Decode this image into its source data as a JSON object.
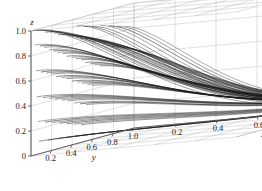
{
  "figure": {
    "type": "3d-line-plot",
    "background": "#ffffff",
    "curve_color": "#1a1a1a",
    "grid_color": "#b9b9b9",
    "axis_color": "#555555"
  },
  "axes": {
    "x": {
      "title": "x",
      "ticks": [
        "0.2",
        "0.4",
        "0.6",
        "0.8",
        "1.0"
      ],
      "tick_values": [
        0.2,
        0.4,
        0.6,
        0.8,
        1.0
      ],
      "range": [
        0,
        1
      ]
    },
    "y": {
      "title": "y",
      "ticks": [
        "0.2",
        "0.4",
        "0.6",
        "0.8",
        "1.0"
      ],
      "tick_values": [
        0.2,
        0.4,
        0.6,
        0.8,
        1.0
      ],
      "range": [
        0,
        1
      ]
    },
    "z": {
      "title": "z",
      "ticks": [
        "0",
        "0.2",
        "0.4",
        "0.6",
        "0.8",
        "1.0"
      ],
      "tick_values": [
        0,
        0.2,
        0.4,
        0.6,
        0.8,
        1.0
      ],
      "range": [
        0,
        1
      ]
    }
  },
  "chart_data": {
    "type": "line",
    "title": "",
    "xlabel": "x",
    "ylabel": "y",
    "zlabel": "z",
    "xlim": [
      0,
      1
    ],
    "ylim": [
      0,
      1
    ],
    "zlim": [
      0,
      1
    ],
    "grid": true,
    "legend": null,
    "projection": {
      "origin_px": [
        31,
        156
      ],
      "x_axis_vector_px": [
        205,
        -19
      ],
      "y_axis_vector_px": [
        103,
        -28
      ],
      "z_axis_vector_px": [
        0,
        -125
      ],
      "note": "corner at x=0,y=0,z=0 is front-bottom; y increases to lower-left-front, x increases to right"
    },
    "series_description": "Family of decaying trajectories; each curve starts on the back-left wall at a given z0 and y0, sweeps across increasing x while z decays to 0, converging near (x=1, y=1, z=0).",
    "series": [
      {
        "name": "t01",
        "z0": 1.0,
        "y0": 0.02,
        "x0": 0.0,
        "decay": 3.2,
        "ybend": 0.97
      },
      {
        "name": "t02",
        "z0": 0.99,
        "y0": 0.06,
        "x0": 0.0,
        "decay": 3.0,
        "ybend": 0.95
      },
      {
        "name": "t03",
        "z0": 0.98,
        "y0": 0.1,
        "x0": 0.0,
        "decay": 2.9,
        "ybend": 0.93
      },
      {
        "name": "t04",
        "z0": 0.96,
        "y0": 0.14,
        "x0": 0.0,
        "decay": 2.8,
        "ybend": 0.92
      },
      {
        "name": "t05",
        "z0": 0.95,
        "y0": 0.19,
        "x0": 0.0,
        "decay": 2.7,
        "ybend": 0.9
      },
      {
        "name": "t06",
        "z0": 0.93,
        "y0": 0.23,
        "x0": 0.0,
        "decay": 2.6,
        "ybend": 0.89
      },
      {
        "name": "t07",
        "z0": 0.91,
        "y0": 0.27,
        "x0": 0.0,
        "decay": 2.55,
        "ybend": 0.88
      },
      {
        "name": "t08",
        "z0": 0.9,
        "y0": 0.31,
        "x0": 0.0,
        "decay": 2.5,
        "ybend": 0.87
      },
      {
        "name": "t09",
        "z0": 0.88,
        "y0": 0.36,
        "x0": 0.0,
        "decay": 2.45,
        "ybend": 0.86
      },
      {
        "name": "t10",
        "z0": 0.87,
        "y0": 0.4,
        "x0": 0.0,
        "decay": 2.4,
        "ybend": 0.85
      },
      {
        "name": "t11",
        "z0": 0.85,
        "y0": 0.44,
        "x0": 0.0,
        "decay": 2.35,
        "ybend": 0.85
      },
      {
        "name": "t12",
        "z0": 0.83,
        "y0": 0.48,
        "x0": 0.0,
        "decay": 2.3,
        "ybend": 0.84
      },
      {
        "name": "t13",
        "z0": 0.82,
        "y0": 0.53,
        "x0": 0.0,
        "decay": 2.25,
        "ybend": 0.84
      },
      {
        "name": "t14",
        "z0": 0.8,
        "y0": 0.57,
        "x0": 0.0,
        "decay": 2.2,
        "ybend": 0.83
      },
      {
        "name": "t15",
        "z0": 0.78,
        "y0": 0.61,
        "x0": 0.0,
        "decay": 2.15,
        "ybend": 0.83
      },
      {
        "name": "t16",
        "z0": 0.76,
        "y0": 0.66,
        "x0": 0.0,
        "decay": 2.1,
        "ybend": 0.82
      },
      {
        "name": "t17",
        "z0": 0.74,
        "y0": 0.7,
        "x0": 0.0,
        "decay": 2.05,
        "ybend": 0.82
      },
      {
        "name": "t18",
        "z0": 0.72,
        "y0": 0.74,
        "x0": 0.0,
        "decay": 2.0,
        "ybend": 0.82
      },
      {
        "name": "t19",
        "z0": 0.7,
        "y0": 0.79,
        "x0": 0.0,
        "decay": 1.95,
        "ybend": 0.81
      },
      {
        "name": "t20",
        "z0": 0.68,
        "y0": 0.83,
        "x0": 0.0,
        "decay": 1.9,
        "ybend": 0.81
      },
      {
        "name": "t21",
        "z0": 0.88,
        "y0": 0.04,
        "x0": 0.0,
        "decay": 2.6,
        "ybend": 0.94
      },
      {
        "name": "t22",
        "z0": 0.86,
        "y0": 0.09,
        "x0": 0.0,
        "decay": 2.5,
        "ybend": 0.92
      },
      {
        "name": "t23",
        "z0": 0.84,
        "y0": 0.13,
        "x0": 0.0,
        "decay": 2.45,
        "ybend": 0.91
      },
      {
        "name": "t24",
        "z0": 0.81,
        "y0": 0.18,
        "x0": 0.0,
        "decay": 2.4,
        "ybend": 0.9
      },
      {
        "name": "t25",
        "z0": 0.79,
        "y0": 0.22,
        "x0": 0.0,
        "decay": 2.3,
        "ybend": 0.89
      },
      {
        "name": "t26",
        "z0": 0.77,
        "y0": 0.26,
        "x0": 0.0,
        "decay": 2.25,
        "ybend": 0.88
      },
      {
        "name": "t27",
        "z0": 0.75,
        "y0": 0.31,
        "x0": 0.0,
        "decay": 2.2,
        "ybend": 0.87
      },
      {
        "name": "t28",
        "z0": 0.72,
        "y0": 0.35,
        "x0": 0.0,
        "decay": 2.15,
        "ybend": 0.86
      },
      {
        "name": "t29",
        "z0": 0.7,
        "y0": 0.4,
        "x0": 0.0,
        "decay": 2.1,
        "ybend": 0.86
      },
      {
        "name": "t30",
        "z0": 0.68,
        "y0": 0.44,
        "x0": 0.0,
        "decay": 2.05,
        "ybend": 0.85
      },
      {
        "name": "t31",
        "z0": 0.66,
        "y0": 0.49,
        "x0": 0.0,
        "decay": 2.0,
        "ybend": 0.85
      },
      {
        "name": "t32",
        "z0": 0.63,
        "y0": 0.53,
        "x0": 0.0,
        "decay": 1.95,
        "ybend": 0.84
      },
      {
        "name": "t33",
        "z0": 0.61,
        "y0": 0.58,
        "x0": 0.0,
        "decay": 1.9,
        "ybend": 0.84
      },
      {
        "name": "t34",
        "z0": 0.59,
        "y0": 0.62,
        "x0": 0.0,
        "decay": 1.85,
        "ybend": 0.83
      },
      {
        "name": "t35",
        "z0": 0.57,
        "y0": 0.67,
        "x0": 0.0,
        "decay": 1.8,
        "ybend": 0.83
      },
      {
        "name": "t36",
        "z0": 0.67,
        "y0": 0.05,
        "x0": 0.0,
        "decay": 2.2,
        "ybend": 0.93
      },
      {
        "name": "t37",
        "z0": 0.65,
        "y0": 0.1,
        "x0": 0.0,
        "decay": 2.15,
        "ybend": 0.91
      },
      {
        "name": "t38",
        "z0": 0.63,
        "y0": 0.15,
        "x0": 0.0,
        "decay": 2.1,
        "ybend": 0.9
      },
      {
        "name": "t39",
        "z0": 0.61,
        "y0": 0.2,
        "x0": 0.0,
        "decay": 2.05,
        "ybend": 0.89
      },
      {
        "name": "t40",
        "z0": 0.58,
        "y0": 0.25,
        "x0": 0.0,
        "decay": 2.0,
        "ybend": 0.88
      },
      {
        "name": "t41",
        "z0": 0.56,
        "y0": 0.3,
        "x0": 0.0,
        "decay": 1.95,
        "ybend": 0.87
      },
      {
        "name": "t42",
        "z0": 0.54,
        "y0": 0.35,
        "x0": 0.0,
        "decay": 1.9,
        "ybend": 0.86
      },
      {
        "name": "t43",
        "z0": 0.51,
        "y0": 0.4,
        "x0": 0.0,
        "decay": 1.85,
        "ybend": 0.86
      },
      {
        "name": "t44",
        "z0": 0.49,
        "y0": 0.45,
        "x0": 0.0,
        "decay": 1.8,
        "ybend": 0.85
      },
      {
        "name": "t45",
        "z0": 0.47,
        "y0": 0.5,
        "x0": 0.0,
        "decay": 1.75,
        "ybend": 0.85
      },
      {
        "name": "t46",
        "z0": 0.45,
        "y0": 0.55,
        "x0": 0.0,
        "decay": 1.7,
        "ybend": 0.84
      },
      {
        "name": "t47",
        "z0": 0.43,
        "y0": 0.6,
        "x0": 0.0,
        "decay": 1.68,
        "ybend": 0.84
      },
      {
        "name": "t48",
        "z0": 0.46,
        "y0": 0.06,
        "x0": 0.0,
        "decay": 1.85,
        "ybend": 0.92
      },
      {
        "name": "t49",
        "z0": 0.44,
        "y0": 0.12,
        "x0": 0.0,
        "decay": 1.8,
        "ybend": 0.9
      },
      {
        "name": "t50",
        "z0": 0.42,
        "y0": 0.18,
        "x0": 0.0,
        "decay": 1.78,
        "ybend": 0.89
      },
      {
        "name": "t51",
        "z0": 0.4,
        "y0": 0.24,
        "x0": 0.0,
        "decay": 1.75,
        "ybend": 0.88
      },
      {
        "name": "t52",
        "z0": 0.38,
        "y0": 0.3,
        "x0": 0.0,
        "decay": 1.7,
        "ybend": 0.87
      },
      {
        "name": "t53",
        "z0": 0.36,
        "y0": 0.36,
        "x0": 0.0,
        "decay": 1.68,
        "ybend": 0.86
      },
      {
        "name": "t54",
        "z0": 0.33,
        "y0": 0.42,
        "x0": 0.0,
        "decay": 1.65,
        "ybend": 0.85
      },
      {
        "name": "t55",
        "z0": 0.31,
        "y0": 0.48,
        "x0": 0.0,
        "decay": 1.6,
        "ybend": 0.85
      },
      {
        "name": "t56",
        "z0": 0.29,
        "y0": 0.54,
        "x0": 0.0,
        "decay": 1.58,
        "ybend": 0.84
      },
      {
        "name": "t57",
        "z0": 0.26,
        "y0": 0.07,
        "x0": 0.0,
        "decay": 1.6,
        "ybend": 0.91
      },
      {
        "name": "t58",
        "z0": 0.24,
        "y0": 0.14,
        "x0": 0.0,
        "decay": 1.58,
        "ybend": 0.9
      },
      {
        "name": "t59",
        "z0": 0.22,
        "y0": 0.21,
        "x0": 0.0,
        "decay": 1.55,
        "ybend": 0.88
      },
      {
        "name": "t60",
        "z0": 0.2,
        "y0": 0.28,
        "x0": 0.0,
        "decay": 1.5,
        "ybend": 0.87
      },
      {
        "name": "t61",
        "z0": 0.18,
        "y0": 0.35,
        "x0": 0.0,
        "decay": 1.48,
        "ybend": 0.86
      },
      {
        "name": "t62",
        "z0": 0.16,
        "y0": 0.42,
        "x0": 0.0,
        "decay": 1.45,
        "ybend": 0.85
      },
      {
        "name": "t63",
        "z0": 0.14,
        "y0": 0.49,
        "x0": 0.0,
        "decay": 1.42,
        "ybend": 0.85
      },
      {
        "name": "t64",
        "z0": 0.1,
        "y0": 0.08,
        "x0": 0.0,
        "decay": 1.4,
        "ybend": 0.9
      },
      {
        "name": "t65",
        "z0": 0.09,
        "y0": 0.17,
        "x0": 0.0,
        "decay": 1.38,
        "ybend": 0.89
      },
      {
        "name": "t66",
        "z0": 0.08,
        "y0": 0.26,
        "x0": 0.0,
        "decay": 1.35,
        "ybend": 0.88
      },
      {
        "name": "t67",
        "z0": 0.07,
        "y0": 0.35,
        "x0": 0.0,
        "decay": 1.32,
        "ybend": 0.87
      },
      {
        "name": "t68",
        "z0": 0.06,
        "y0": 0.44,
        "x0": 0.0,
        "decay": 1.3,
        "ybend": 0.86
      },
      {
        "name": "t69",
        "z0": 0.94,
        "y0": 0.45,
        "x0": 0.0,
        "decay": 2.9,
        "ybend": 0.88
      },
      {
        "name": "t70",
        "z0": 0.92,
        "y0": 0.52,
        "x0": 0.0,
        "decay": 2.8,
        "ybend": 0.87
      },
      {
        "name": "t71",
        "z0": 0.9,
        "y0": 0.6,
        "x0": 0.0,
        "decay": 2.7,
        "ybend": 0.86
      },
      {
        "name": "t72",
        "z0": 0.89,
        "y0": 0.68,
        "x0": 0.0,
        "decay": 2.6,
        "ybend": 0.85
      },
      {
        "name": "t73",
        "z0": 0.87,
        "y0": 0.76,
        "x0": 0.0,
        "decay": 2.5,
        "ybend": 0.85
      },
      {
        "name": "t74",
        "z0": 0.85,
        "y0": 0.84,
        "x0": 0.0,
        "decay": 2.4,
        "ybend": 0.84
      },
      {
        "name": "t75",
        "z0": 0.83,
        "y0": 0.92,
        "x0": 0.0,
        "decay": 2.3,
        "ybend": 0.84
      }
    ]
  }
}
